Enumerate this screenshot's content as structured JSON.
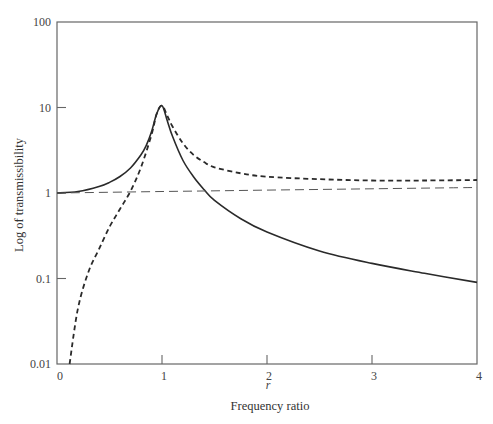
{
  "chart_data": {
    "type": "line",
    "title": "",
    "xlabel": "Frequency ratio",
    "xlabel_symbol": "r",
    "ylabel": "Log of transmissibility",
    "xscale": "linear",
    "yscale": "log",
    "xlim": [
      0,
      4
    ],
    "ylim": [
      0.01,
      100
    ],
    "x_ticks": [
      0,
      1,
      2,
      3,
      4
    ],
    "x_tick_labels": [
      "0",
      "1",
      "2",
      "3",
      "4"
    ],
    "y_ticks": [
      0.01,
      0.1,
      1,
      10,
      100
    ],
    "y_tick_labels": [
      "0.01",
      "0.1",
      "1",
      "10",
      "100"
    ],
    "grid": false,
    "legend": null,
    "series": [
      {
        "name": "solid curve",
        "style": "solid",
        "x": [
          0,
          0.2,
          0.4,
          0.5,
          0.6,
          0.7,
          0.8,
          0.85,
          0.9,
          0.95,
          1.0,
          1.05,
          1.1,
          1.2,
          1.3,
          1.4,
          1.5,
          1.75,
          2.0,
          2.5,
          3.0,
          3.5,
          4.0
        ],
        "y": [
          1.0,
          1.04,
          1.19,
          1.33,
          1.56,
          1.96,
          2.8,
          3.6,
          5.2,
          8.5,
          10.5,
          7.0,
          4.6,
          2.4,
          1.55,
          1.1,
          0.82,
          0.5,
          0.35,
          0.21,
          0.15,
          0.115,
          0.09
        ]
      },
      {
        "name": "heavy dashed curve",
        "style": "heavy-dashed",
        "x": [
          0.12,
          0.2,
          0.3,
          0.4,
          0.5,
          0.6,
          0.7,
          0.8,
          0.9,
          0.95,
          1.0,
          1.05,
          1.1,
          1.2,
          1.3,
          1.4,
          1.5,
          1.75,
          2.0,
          2.5,
          3.0,
          3.5,
          4.0
        ],
        "y": [
          0.01,
          0.045,
          0.12,
          0.22,
          0.4,
          0.65,
          1.05,
          2.0,
          4.8,
          8.5,
          10.5,
          8.0,
          6.0,
          3.8,
          2.8,
          2.3,
          2.0,
          1.7,
          1.55,
          1.45,
          1.4,
          1.4,
          1.42
        ]
      },
      {
        "name": "light dashed reference line",
        "style": "light-dashed",
        "x": [
          0,
          1,
          2,
          3,
          4
        ],
        "y": [
          1.0,
          1.04,
          1.08,
          1.12,
          1.16
        ]
      }
    ]
  },
  "axes": {
    "xlabel": "Frequency ratio",
    "xlabel_symbol": "r",
    "ylabel": "Log of transmissibility"
  }
}
